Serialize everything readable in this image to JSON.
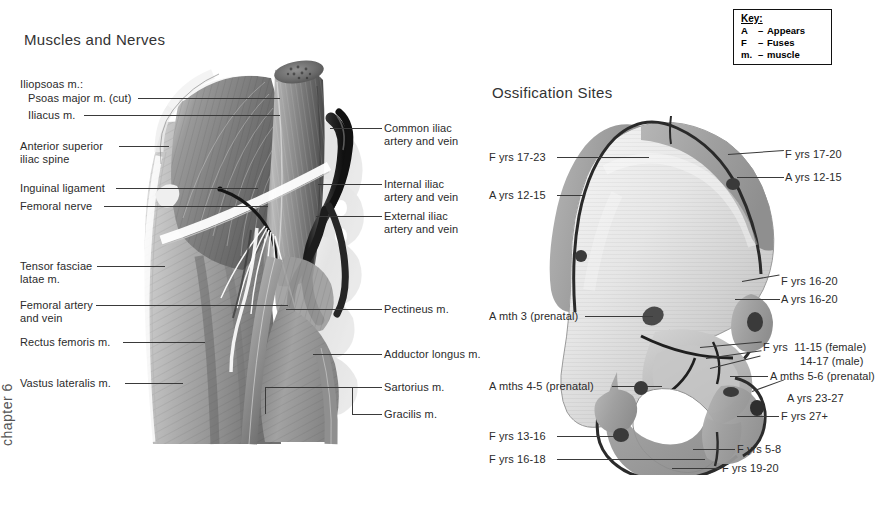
{
  "page": {
    "background": "#ffffff",
    "chapter_label": "chapter 6",
    "width": 887,
    "height": 511
  },
  "key_box": {
    "title": "Key:",
    "rows": [
      {
        "symbol": "A",
        "dash": "–",
        "meaning": "Appears"
      },
      {
        "symbol": "F",
        "dash": "–",
        "meaning": "Fuses"
      },
      {
        "symbol": "m.",
        "dash": "–",
        "meaning": "muscle"
      }
    ]
  },
  "left_figure": {
    "title": "Muscles and Nerves",
    "labels_left": [
      {
        "text": "Iliopsoas m.:",
        "x": 20,
        "y": 78
      },
      {
        "text": "Psoas major m. (cut)",
        "x": 28,
        "y": 92
      },
      {
        "text": "Iliacus m.",
        "x": 28,
        "y": 109
      },
      {
        "text": "Anterior superior\niliac spine",
        "x": 20,
        "y": 140
      },
      {
        "text": "Inguinal ligament",
        "x": 20,
        "y": 182
      },
      {
        "text": "Femoral nerve",
        "x": 20,
        "y": 200
      },
      {
        "text": "Tensor fasciae\nlatae m.",
        "x": 20,
        "y": 260
      },
      {
        "text": "Femoral artery\nand vein",
        "x": 20,
        "y": 299
      },
      {
        "text": "Rectus femoris m.",
        "x": 20,
        "y": 336
      },
      {
        "text": "Vastus lateralis m.",
        "x": 20,
        "y": 377
      }
    ],
    "labels_right": [
      {
        "text": "Common iliac\nartery and vein",
        "x": 384,
        "y": 122
      },
      {
        "text": "Internal iliac\nartery and vein",
        "x": 384,
        "y": 178
      },
      {
        "text": "External iliac\nartery and vein",
        "x": 384,
        "y": 210
      },
      {
        "text": "Pectineus m.",
        "x": 384,
        "y": 303
      },
      {
        "text": "Adductor longus m.",
        "x": 384,
        "y": 348
      },
      {
        "text": "Sartorius m.",
        "x": 384,
        "y": 381
      },
      {
        "text": "Gracilis m.",
        "x": 384,
        "y": 408
      }
    ]
  },
  "right_figure": {
    "title": "Ossification Sites",
    "labels_left": [
      {
        "text": "F yrs 17-23",
        "x": 489,
        "y": 151
      },
      {
        "text": "A yrs 12-15",
        "x": 489,
        "y": 189
      },
      {
        "text": "A mth 3 (prenatal)",
        "x": 489,
        "y": 310
      },
      {
        "text": "A mths 4-5 (prenatal)",
        "x": 489,
        "y": 380
      },
      {
        "text": "F yrs 13-16",
        "x": 489,
        "y": 430
      },
      {
        "text": "F yrs 16-18",
        "x": 489,
        "y": 453
      }
    ],
    "labels_right": [
      {
        "text": "F yrs 17-20",
        "x": 785,
        "y": 148
      },
      {
        "text": "A yrs 12-15",
        "x": 785,
        "y": 171
      },
      {
        "text": "F yrs 16-20",
        "x": 781,
        "y": 275
      },
      {
        "text": "A yrs 16-20",
        "x": 781,
        "y": 293
      },
      {
        "text": "F yrs  11-15 (female)",
        "x": 763,
        "y": 341
      },
      {
        "text": "14-17 (male)",
        "x": 800,
        "y": 355
      },
      {
        "text": "A mths 5-6 (prenatal)",
        "x": 770,
        "y": 370
      },
      {
        "text": "A yrs 23-27",
        "x": 787,
        "y": 392
      },
      {
        "text": "F yrs 27+",
        "x": 781,
        "y": 410
      },
      {
        "text": "F yrs 5-8",
        "x": 737,
        "y": 443
      },
      {
        "text": "F yrs 19-20",
        "x": 722,
        "y": 462
      }
    ]
  }
}
